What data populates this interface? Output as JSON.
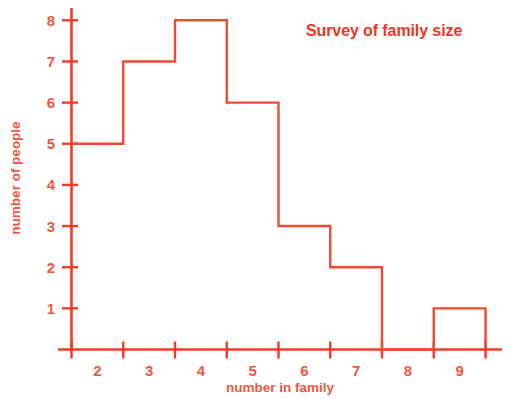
{
  "chart_data": {
    "type": "bar",
    "title": "Survey of family size",
    "xlabel": "number in family",
    "ylabel": "number of people",
    "categories": [
      "2",
      "3",
      "4",
      "5",
      "6",
      "7",
      "8",
      "9"
    ],
    "values": [
      5,
      7,
      8,
      6,
      3,
      2,
      0,
      1
    ],
    "bin_edges": [
      1.5,
      2.5,
      3.5,
      4.5,
      5.5,
      6.5,
      7.5,
      8.5,
      9.5
    ],
    "xlim": [
      1.5,
      9.5
    ],
    "ylim": [
      0,
      8
    ],
    "ytick_labels": [
      "1",
      "2",
      "3",
      "4",
      "5",
      "6",
      "7",
      "8"
    ],
    "ytick_values": [
      1,
      2,
      3,
      4,
      5,
      6,
      7,
      8
    ],
    "xtick_labels": [
      "2",
      "3",
      "4",
      "5",
      "6",
      "7",
      "8",
      "9"
    ],
    "grid": false,
    "legend": "none",
    "series_color": "#f04a33",
    "axis_color": "#ef3b28",
    "title_color": "#ee3524",
    "label_color": "#f0573f",
    "background_color": "#ffffff",
    "bar_style": "outline"
  }
}
